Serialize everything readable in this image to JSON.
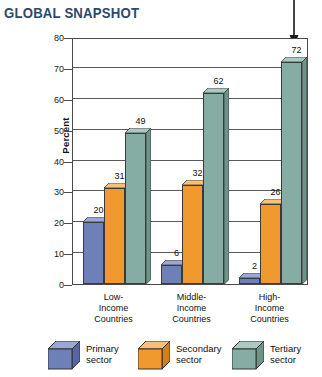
{
  "title": "GLOBAL SNAPSHOT",
  "colors": {
    "title": "#2d4a6b",
    "primary_front": "#6d80b8",
    "primary_top": "#9aa8d2",
    "primary_side": "#5566a0",
    "secondary_front": "#f0992f",
    "secondary_top": "#f5c078",
    "secondary_side": "#d47f1c",
    "tertiary_front": "#85ada3",
    "tertiary_top": "#aac9c1",
    "tertiary_side": "#6d9489",
    "axis": "#4a4a4a",
    "gridline": "#5a5a5a"
  },
  "annotation": {
    "arrow": "down-arrow-callout"
  },
  "legend": {
    "position": "bottom",
    "items": [
      {
        "name": "primary",
        "line1": "Primary",
        "line2": "sector",
        "color": "#6d80b8"
      },
      {
        "name": "secondary",
        "line1": "Secondary",
        "line2": "sector",
        "color": "#f0992f"
      },
      {
        "name": "tertiary",
        "line1": "Tertiary",
        "line2": "sector",
        "color": "#85ada3"
      }
    ]
  },
  "xlabels": [
    {
      "line1": "Low-",
      "line2": "Income",
      "line3": "Countries"
    },
    {
      "line1": "Middle-",
      "line2": "Income",
      "line3": "Countries"
    },
    {
      "line1": "High-",
      "line2": "Income",
      "line3": "Countries"
    }
  ],
  "chart_data": {
    "type": "bar",
    "title": "GLOBAL SNAPSHOT",
    "xlabel": "",
    "ylabel": "Percent",
    "ylim": [
      0,
      80
    ],
    "yticks": [
      0,
      10,
      20,
      30,
      40,
      50,
      60,
      70,
      80
    ],
    "grid": true,
    "legend_position": "bottom",
    "categories": [
      "Low-Income Countries",
      "Middle-Income Countries",
      "High-Income Countries"
    ],
    "series": [
      {
        "name": "Primary sector",
        "color": "#6d80b8",
        "values": [
          20,
          6,
          2
        ]
      },
      {
        "name": "Secondary sector",
        "color": "#f0992f",
        "values": [
          31,
          32,
          26
        ]
      },
      {
        "name": "Tertiary sector",
        "color": "#85ada3",
        "values": [
          49,
          62,
          72
        ]
      }
    ]
  }
}
